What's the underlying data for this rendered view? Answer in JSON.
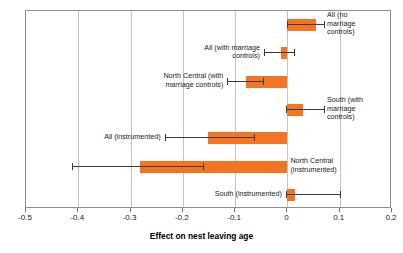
{
  "chart_data": {
    "type": "bar",
    "orientation": "horizontal",
    "title": "",
    "xlabel": "Effect on nest leaving age",
    "ylabel": "",
    "xlim": [
      -0.5,
      0.2
    ],
    "xticks": [
      -0.5,
      -0.4,
      -0.3,
      -0.2,
      -0.1,
      0,
      0.1,
      0.2
    ],
    "xticklabels": [
      "-0.5",
      "-0.4",
      "-0.3",
      "-0.2",
      "-0.1",
      "0",
      "0.1",
      "0.2"
    ],
    "grid": "vertical",
    "legend": "none",
    "bar_color": "#f37521",
    "error_color": "#3b3b3b",
    "categories": [
      "All (no marriage controls)",
      "All (with marriage controls)",
      "North Central (with marriage controls)",
      "South (with marriage controls)",
      "All (instrumented)",
      "North Central (instrumented)",
      "South (instrumented)"
    ],
    "values": [
      0.054,
      -0.012,
      -0.079,
      0.03,
      -0.151,
      -0.282,
      0.015
    ],
    "ci_low": [
      0.0,
      -0.045,
      -0.115,
      -0.002,
      -0.235,
      -0.412,
      -0.003
    ],
    "ci_high": [
      0.07,
      0.012,
      -0.046,
      0.07,
      -0.063,
      -0.161,
      0.1
    ],
    "labels": [
      {
        "text": "All (no\nmarriage\ncontrols)",
        "side": "right"
      },
      {
        "text": "All (with marriage\ncontrols)",
        "side": "left"
      },
      {
        "text": "North Central (with\nmarriage controls)",
        "side": "left"
      },
      {
        "text": "South (with\nmarriage\ncontrols)",
        "side": "right"
      },
      {
        "text": "All (instrumented)",
        "side": "left"
      },
      {
        "text": "North Central\n(instrumented)",
        "side": "right"
      },
      {
        "text": "South (instrumented)",
        "side": "left"
      }
    ]
  }
}
